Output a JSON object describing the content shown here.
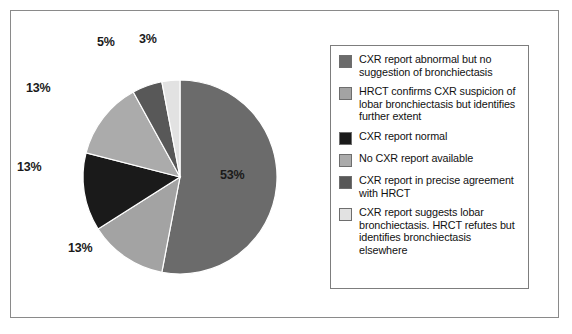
{
  "figure": {
    "background_color": "#ffffff",
    "frame_color": "#8a8a8a"
  },
  "chart_data": {
    "type": "pie",
    "title": "",
    "subtitle": "",
    "xlabel": "",
    "ylabel": "",
    "legend_position": "right",
    "grid": false,
    "start_angle_deg": 0,
    "direction": "clockwise",
    "categories": [
      "CXR report abnormal but no suggestion of bronchiectasis",
      "HRCT confirms CXR suspicion of lobar bronchiectasis but identifies further extent",
      "CXR report normal",
      "No CXR report available",
      "CXR report in precise agreement with HRCT",
      "CXR report suggests lobar bronchiectasis. HRCT refutes but identifies bronchiectasis elsewhere"
    ],
    "values": [
      53,
      13,
      13,
      13,
      5,
      3
    ],
    "data_labels": [
      "53%",
      "13%",
      "13%",
      "13%",
      "5%",
      "3%"
    ],
    "colors": [
      "#6b6b6b",
      "#a3a3a3",
      "#1a1a1a",
      "#ababab",
      "#585858",
      "#e2e2e2"
    ]
  },
  "pie": {
    "slices": [
      {
        "id": "slice-53",
        "label": "53%",
        "value": 53,
        "color": "#6b6b6b"
      },
      {
        "id": "slice-13-a",
        "label": "13%",
        "value": 13,
        "color": "#a3a3a3"
      },
      {
        "id": "slice-13-b",
        "label": "13%",
        "value": 13,
        "color": "#1a1a1a"
      },
      {
        "id": "slice-13-c",
        "label": "13%",
        "value": 13,
        "color": "#ababab"
      },
      {
        "id": "slice-5",
        "label": "5%",
        "value": 5,
        "color": "#585858"
      },
      {
        "id": "slice-3",
        "label": "3%",
        "value": 3,
        "color": "#e2e2e2"
      }
    ],
    "labels": {
      "pct_53": "53%",
      "pct_13_bottom": "13%",
      "pct_13_left": "13%",
      "pct_13_upperleft": "13%",
      "pct_5": "5%",
      "pct_3": "3%"
    }
  },
  "legend": {
    "items": [
      {
        "color": "#6b6b6b",
        "text": "CXR report abnormal but no suggestion of bronchiectasis"
      },
      {
        "color": "#a3a3a3",
        "text": "HRCT confirms CXR suspicion of lobar bronchiectasis but identifies further extent"
      },
      {
        "color": "#1a1a1a",
        "text": "CXR report normal"
      },
      {
        "color": "#ababab",
        "text": "No CXR report available"
      },
      {
        "color": "#585858",
        "text": "CXR report in precise agreement with HRCT"
      },
      {
        "color": "#e2e2e2",
        "text": "CXR report suggests lobar bronchiectasis. HRCT refutes but identifies bronchiectasis elsewhere"
      }
    ]
  }
}
